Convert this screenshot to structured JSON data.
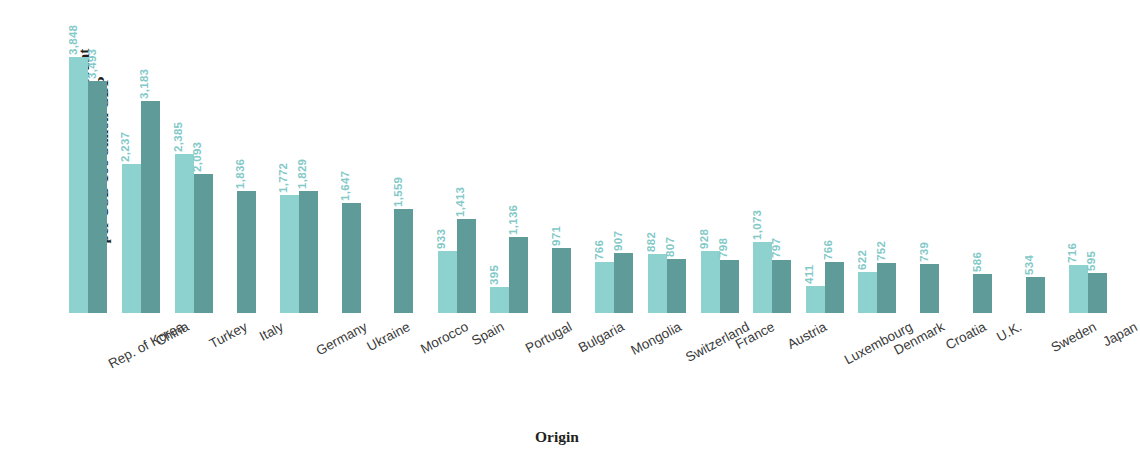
{
  "chart_data": {
    "type": "bar",
    "title": "",
    "xlabel": "Origin",
    "ylabel": "Resident application design count\nper USD 100 billion GDP",
    "ylim": [
      0,
      4000
    ],
    "grid": false,
    "legend": "none",
    "orientation": "vertical",
    "grouping": "grouped",
    "categories": [
      "Rep. of Korea",
      "China",
      "Turkey",
      "Italy",
      "Germany",
      "Ukraine",
      "Morocco",
      "Spain",
      "Portugal",
      "Bulgaria",
      "Mongolia",
      "Switzerland",
      "France",
      "Austria",
      "Luxembourg",
      "Denmark",
      "Croatia",
      "U.K.",
      "Sweden",
      "Japan"
    ],
    "series": [
      {
        "name": "light",
        "color": "#8ed2d0",
        "values": [
          3848,
          2237,
          2385,
          null,
          1772,
          null,
          null,
          933,
          395,
          null,
          766,
          882,
          928,
          1073,
          411,
          622,
          null,
          null,
          null,
          716
        ]
      },
      {
        "name": "dark",
        "color": "#5f9c99",
        "values": [
          3493,
          3183,
          2093,
          1836,
          1829,
          1647,
          1559,
          1413,
          1136,
          971,
          907,
          807,
          798,
          797,
          766,
          752,
          739,
          586,
          534,
          595
        ]
      }
    ],
    "value_labels": {
      "light": [
        "3,848",
        "2,237",
        "2,385",
        "",
        "1,772",
        "",
        "",
        "933",
        "395",
        "",
        "766",
        "882",
        "928",
        "1,073",
        "411",
        "622",
        "",
        "",
        "",
        "716"
      ],
      "dark": [
        "3,493",
        "3,183",
        "2,093",
        "1,836",
        "1,829",
        "1,647",
        "1,559",
        "1,413",
        "1,136",
        "971",
        "907",
        "807",
        "798",
        "797",
        "766",
        "752",
        "739",
        "586",
        "534",
        "595"
      ]
    }
  },
  "axes": {
    "y_title": "Resident application design count\nper USD 100 billion GDP",
    "x_title": "Origin"
  },
  "colors": {
    "bar_light": "#8ed2d0",
    "bar_dark": "#5f9c99",
    "value_label": "#82c9c8",
    "axis_text": "#231f20",
    "category_text": "#3a3a3a",
    "background": "#ffffff"
  }
}
